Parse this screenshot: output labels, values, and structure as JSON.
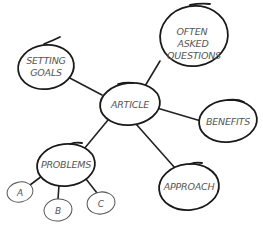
{
  "diagram": {
    "type": "mind-map",
    "center": {
      "label": "ARTICLE"
    },
    "nodes": {
      "setting_goals": {
        "line1": "SETTING",
        "line2": "GOALS"
      },
      "faq": {
        "line1": "OFTEN",
        "line2": "ASKED",
        "line3": "QUESTIONS"
      },
      "article": {
        "label": "ARTICLE"
      },
      "benefits": {
        "label": "BENEFITS"
      },
      "problems": {
        "label": "PROBLEMS"
      },
      "approach": {
        "label": "APPROACH"
      },
      "a": {
        "label": "A"
      },
      "b": {
        "label": "B"
      },
      "c": {
        "label": "C"
      }
    },
    "edges": [
      [
        "ARTICLE",
        "SETTING GOALS"
      ],
      [
        "ARTICLE",
        "OFTEN ASKED QUESTIONS"
      ],
      [
        "ARTICLE",
        "BENEFITS"
      ],
      [
        "ARTICLE",
        "PROBLEMS"
      ],
      [
        "ARTICLE",
        "APPROACH"
      ],
      [
        "PROBLEMS",
        "A"
      ],
      [
        "PROBLEMS",
        "B"
      ],
      [
        "PROBLEMS",
        "C"
      ]
    ]
  }
}
